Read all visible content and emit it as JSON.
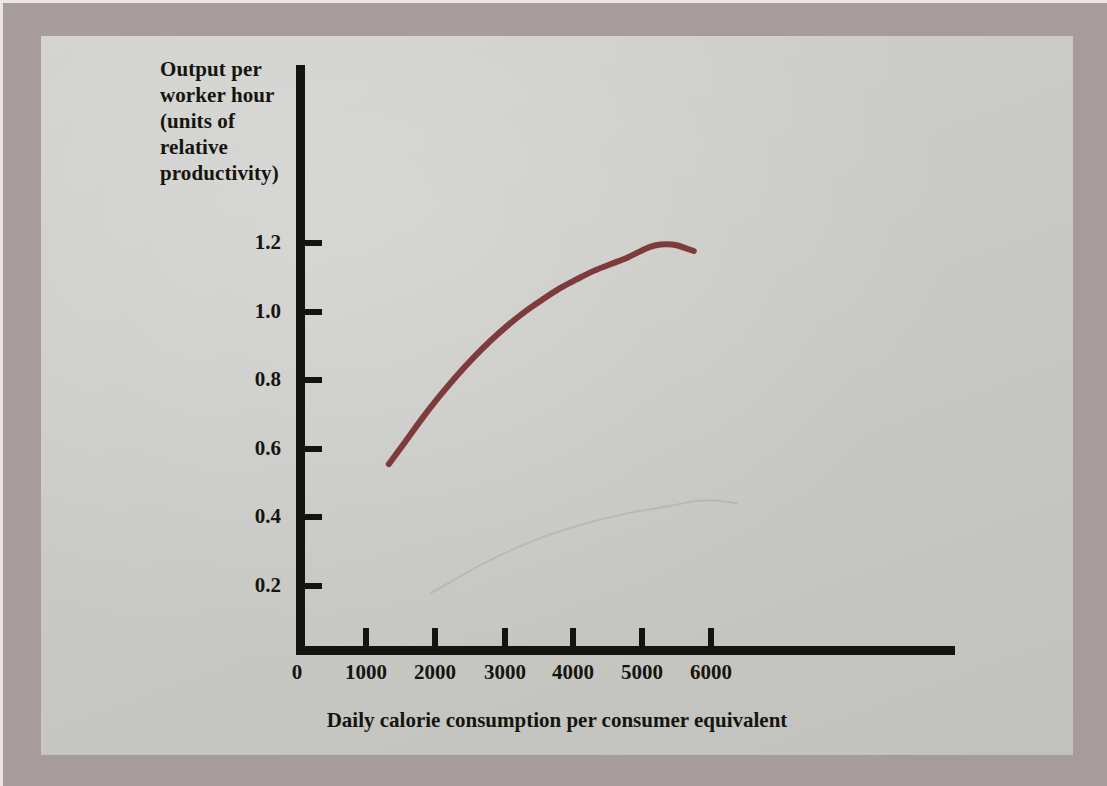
{
  "figure": {
    "panel_bg": "#c8c9c5",
    "border_bg": "#a89b9d",
    "axis_color": "#151311",
    "curve_color": "#7d3b3b"
  },
  "y_axis": {
    "title_lines": [
      "Output per",
      "worker hour",
      "(units of",
      "relative",
      "productivity)"
    ],
    "title_full": "Output per worker hour (units of relative productivity)",
    "ticks": [
      "1.2",
      "1.0",
      "0.8",
      "0.6",
      "0.4",
      "0.2"
    ]
  },
  "x_axis": {
    "title": "Daily calorie consumption per consumer equivalent",
    "ticks": [
      "0",
      "1000",
      "2000",
      "3000",
      "4000",
      "5000",
      "6000"
    ]
  },
  "chart_data": {
    "type": "line",
    "title": "",
    "subtitle": "",
    "xlabel": "Daily calorie consumption per consumer equivalent",
    "ylabel": "Output per worker hour (units of relative productivity)",
    "xlim": [
      0,
      7000
    ],
    "ylim": [
      0,
      1.3
    ],
    "xticks": [
      0,
      1000,
      2000,
      3000,
      4000,
      5000,
      6000
    ],
    "yticks": [
      0.2,
      0.4,
      0.6,
      0.8,
      1.0,
      1.2
    ],
    "grid": false,
    "legend": "none",
    "series": [
      {
        "name": "Output per worker hour",
        "color": "#7d3b3b",
        "linewidth": 6,
        "x": [
          1280,
          1500,
          1750,
          2000,
          2250,
          2500,
          2750,
          3000,
          3250,
          3500,
          3750,
          4000,
          4250,
          4500,
          4750,
          5000,
          5150,
          5300,
          5450,
          5700
        ],
        "y": [
          0.545,
          0.605,
          0.675,
          0.74,
          0.8,
          0.855,
          0.905,
          0.95,
          0.99,
          1.025,
          1.058,
          1.085,
          1.11,
          1.13,
          1.15,
          1.175,
          1.185,
          1.188,
          1.185,
          1.168
        ]
      }
    ],
    "annotations": []
  }
}
